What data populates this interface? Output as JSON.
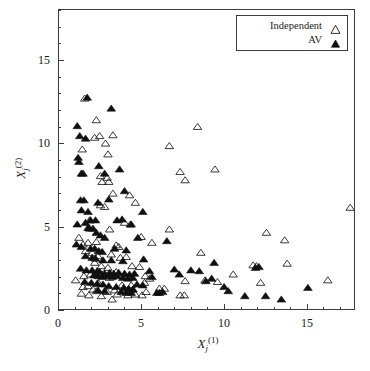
{
  "figure": {
    "width": 370,
    "height": 371,
    "background": "#ffffff",
    "foreground": "#1a1a1a",
    "frame_color": "#3d3d3d"
  },
  "legend": {
    "position": "top-right",
    "entries": [
      {
        "label": "Independent",
        "marker": "open-triangle"
      },
      {
        "label": "AV",
        "marker": "filled-triangle"
      }
    ]
  },
  "axes": {
    "x": {
      "title_var": "X",
      "title_sub": "j",
      "title_sup": "(1)",
      "ticklabels": [
        "0",
        "5",
        "10",
        "15"
      ],
      "tickvalues": [
        0,
        5,
        10,
        15
      ],
      "minor_per_major": 5
    },
    "y": {
      "title_var": "X",
      "title_sub": "j",
      "title_sup": "(2)",
      "ticklabels": [
        "0",
        "5",
        "10",
        "15"
      ],
      "tickvalues": [
        0,
        5,
        10,
        15
      ],
      "minor_per_major": 5
    }
  },
  "chart_data": {
    "type": "scatter",
    "title": "",
    "xlabel": "X_j^(1)",
    "ylabel": "X_j^(2)",
    "xlim": [
      0,
      17.9
    ],
    "ylim": [
      0,
      18.05
    ],
    "grid": false,
    "legend_position": "top-right",
    "series": [
      {
        "name": "Independent",
        "marker": "open-triangle",
        "color": "#1a1a1a",
        "fill": "none",
        "points": [
          [
            1.55,
            12.75
          ],
          [
            2.25,
            11.45
          ],
          [
            2.45,
            10.5
          ],
          [
            2.15,
            10.4
          ],
          [
            3.25,
            10.55
          ],
          [
            2.8,
            10.05
          ],
          [
            1.4,
            9.7
          ],
          [
            2.95,
            9.4
          ],
          [
            6.65,
            9.9
          ],
          [
            8.35,
            11.05
          ],
          [
            2.5,
            8.1
          ],
          [
            2.9,
            8.0
          ],
          [
            2.6,
            7.75
          ],
          [
            3.0,
            7.75
          ],
          [
            7.3,
            8.35
          ],
          [
            9.4,
            8.5
          ],
          [
            7.6,
            7.85
          ],
          [
            3.25,
            7.05
          ],
          [
            4.25,
            6.95
          ],
          [
            4.6,
            6.5
          ],
          [
            2.5,
            6.35
          ],
          [
            2.75,
            6.25
          ],
          [
            1.85,
            5.45
          ],
          [
            3.95,
            5.3
          ],
          [
            4.3,
            5.2
          ],
          [
            3.05,
            4.9
          ],
          [
            6.65,
            4.9
          ],
          [
            12.5,
            4.7
          ],
          [
            13.6,
            4.25
          ],
          [
            17.55,
            6.2
          ],
          [
            1.2,
            4.4
          ],
          [
            1.45,
            4.0
          ],
          [
            1.75,
            4.1
          ],
          [
            2.25,
            4.15
          ],
          [
            3.45,
            3.95
          ],
          [
            3.6,
            3.85
          ],
          [
            5.6,
            4.1
          ],
          [
            4.95,
            4.45
          ],
          [
            1.6,
            3.6
          ],
          [
            2.0,
            3.5
          ],
          [
            2.35,
            3.3
          ],
          [
            3.15,
            3.4
          ],
          [
            3.7,
            3.2
          ],
          [
            4.05,
            3.25
          ],
          [
            8.55,
            3.5
          ],
          [
            13.75,
            2.85
          ],
          [
            2.15,
            2.9
          ],
          [
            2.55,
            2.7
          ],
          [
            2.95,
            2.6
          ],
          [
            4.4,
            2.7
          ],
          [
            4.85,
            2.65
          ],
          [
            11.7,
            2.75
          ],
          [
            11.9,
            2.7
          ],
          [
            1.0,
            1.85
          ],
          [
            1.5,
            2.1
          ],
          [
            1.9,
            2.2
          ],
          [
            2.6,
            2.2
          ],
          [
            3.05,
            2.0
          ],
          [
            3.45,
            2.35
          ],
          [
            5.2,
            2.1
          ],
          [
            5.45,
            1.95
          ],
          [
            7.6,
            1.8
          ],
          [
            8.8,
            1.85
          ],
          [
            9.55,
            1.75
          ],
          [
            10.5,
            2.2
          ],
          [
            12.15,
            1.7
          ],
          [
            16.2,
            1.85
          ],
          [
            1.45,
            1.45
          ],
          [
            1.75,
            1.5
          ],
          [
            2.05,
            1.3
          ],
          [
            2.25,
            1.2
          ],
          [
            1.35,
            1.05
          ],
          [
            1.8,
            0.95
          ],
          [
            2.55,
            0.9
          ],
          [
            3.2,
            0.7
          ],
          [
            3.5,
            1.0
          ],
          [
            4.15,
            0.95
          ],
          [
            4.6,
            1.0
          ],
          [
            5.0,
            0.95
          ],
          [
            5.25,
            1.15
          ],
          [
            7.3,
            0.95
          ],
          [
            7.55,
            0.95
          ],
          [
            2.9,
            1.15
          ],
          [
            3.35,
            1.25
          ],
          [
            4.45,
            1.3
          ],
          [
            2.4,
            1.65
          ],
          [
            3.8,
            1.55
          ],
          [
            4.35,
            1.55
          ],
          [
            5.15,
            1.7
          ],
          [
            6.05,
            1.35
          ],
          [
            6.35,
            1.35
          ]
        ]
      },
      {
        "name": "AV",
        "marker": "filled-triangle",
        "color": "#101010",
        "fill": "#101010",
        "points": [
          [
            1.7,
            12.8
          ],
          [
            3.15,
            12.15
          ],
          [
            1.1,
            11.1
          ],
          [
            1.25,
            10.5
          ],
          [
            1.6,
            10.35
          ],
          [
            1.15,
            9.2
          ],
          [
            1.2,
            8.95
          ],
          [
            2.4,
            8.7
          ],
          [
            1.35,
            8.25
          ],
          [
            1.45,
            8.25
          ],
          [
            2.75,
            8.25
          ],
          [
            3.65,
            8.5
          ],
          [
            1.3,
            6.65
          ],
          [
            1.5,
            6.65
          ],
          [
            2.35,
            6.5
          ],
          [
            3.0,
            6.7
          ],
          [
            3.95,
            7.2
          ],
          [
            1.35,
            6.05
          ],
          [
            1.75,
            5.95
          ],
          [
            5.05,
            5.95
          ],
          [
            1.1,
            5.2
          ],
          [
            1.6,
            5.3
          ],
          [
            1.9,
            5.45
          ],
          [
            2.2,
            5.45
          ],
          [
            3.5,
            5.45
          ],
          [
            3.8,
            5.5
          ],
          [
            4.35,
            5.2
          ],
          [
            1.75,
            5.0
          ],
          [
            1.85,
            4.95
          ],
          [
            2.05,
            4.95
          ],
          [
            2.25,
            4.7
          ],
          [
            2.5,
            4.55
          ],
          [
            2.75,
            4.4
          ],
          [
            4.75,
            4.4
          ],
          [
            6.5,
            4.2
          ],
          [
            1.05,
            4.0
          ],
          [
            1.35,
            3.85
          ],
          [
            1.9,
            3.75
          ],
          [
            2.15,
            3.75
          ],
          [
            2.4,
            3.6
          ],
          [
            2.6,
            3.55
          ],
          [
            3.35,
            3.75
          ],
          [
            4.05,
            3.65
          ],
          [
            1.6,
            3.3
          ],
          [
            2.0,
            3.2
          ],
          [
            2.2,
            3.15
          ],
          [
            2.65,
            3.05
          ],
          [
            3.15,
            3.05
          ],
          [
            3.85,
            3.0
          ],
          [
            5.1,
            3.1
          ],
          [
            9.35,
            2.9
          ],
          [
            1.3,
            2.55
          ],
          [
            1.65,
            2.45
          ],
          [
            2.0,
            2.45
          ],
          [
            2.3,
            2.4
          ],
          [
            2.45,
            2.35
          ],
          [
            2.75,
            2.25
          ],
          [
            3.05,
            2.3
          ],
          [
            3.3,
            2.25
          ],
          [
            3.6,
            2.3
          ],
          [
            3.95,
            2.25
          ],
          [
            4.25,
            2.2
          ],
          [
            4.55,
            2.25
          ],
          [
            5.45,
            2.4
          ],
          [
            6.95,
            2.5
          ],
          [
            7.95,
            2.45
          ],
          [
            8.45,
            2.4
          ],
          [
            11.85,
            2.6
          ],
          [
            12.05,
            2.65
          ],
          [
            2.1,
            2.15
          ],
          [
            2.35,
            2.1
          ],
          [
            2.6,
            2.05
          ],
          [
            2.9,
            2.1
          ],
          [
            3.2,
            2.05
          ],
          [
            3.5,
            2.1
          ],
          [
            3.85,
            2.0
          ],
          [
            4.15,
            1.95
          ],
          [
            4.45,
            2.0
          ],
          [
            5.6,
            2.05
          ],
          [
            7.25,
            2.2
          ],
          [
            8.85,
            1.8
          ],
          [
            9.2,
            1.95
          ],
          [
            1.55,
            1.75
          ],
          [
            1.95,
            1.7
          ],
          [
            2.3,
            1.65
          ],
          [
            2.65,
            1.6
          ],
          [
            3.0,
            1.5
          ],
          [
            3.45,
            1.45
          ],
          [
            3.9,
            1.4
          ],
          [
            4.2,
            1.35
          ],
          [
            4.45,
            1.3
          ],
          [
            4.7,
            1.6
          ],
          [
            5.05,
            1.55
          ],
          [
            5.9,
            1.1
          ],
          [
            6.05,
            1.1
          ],
          [
            6.25,
            1.15
          ],
          [
            2.35,
            1.25
          ],
          [
            2.75,
            1.2
          ],
          [
            3.75,
            1.15
          ],
          [
            4.05,
            1.1
          ],
          [
            4.35,
            1.1
          ],
          [
            10.2,
            1.2
          ],
          [
            11.2,
            0.9
          ],
          [
            12.45,
            0.9
          ],
          [
            13.4,
            0.7
          ],
          [
            15.0,
            1.4
          ],
          [
            9.95,
            1.45
          ]
        ]
      }
    ]
  }
}
